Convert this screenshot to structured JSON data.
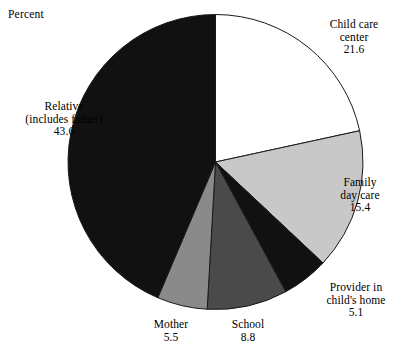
{
  "chart_data": {
    "type": "pie",
    "title": "",
    "subtitle": "",
    "xlabel": "",
    "ylabel": "Percent",
    "unit_note": "Percent",
    "legend_position": "none",
    "grid": false,
    "start_angle_deg": 0,
    "direction": "clockwise",
    "categories": [
      "Child care center",
      "Family day care",
      "Provider in child's home",
      "School",
      "Mother",
      "Relative (includes father)"
    ],
    "values": [
      21.6,
      15.4,
      5.1,
      8.8,
      5.5,
      43.6
    ],
    "total": 100.0,
    "colors": [
      "#ffffff",
      "#c8c8c8",
      "#111111",
      "#4a4a4a",
      "#8a8a8a",
      "#111111"
    ],
    "stroke": "#1a1a1a"
  },
  "labels": [
    {
      "name": "child-care-center",
      "lines": [
        "Child care",
        "center"
      ],
      "value": "21.6",
      "color": "#ffffff"
    },
    {
      "name": "family-day-care",
      "lines": [
        "Family",
        "day care"
      ],
      "value": "15.4",
      "color": "#c8c8c8"
    },
    {
      "name": "provider-in-childs-home",
      "lines": [
        "Provider in",
        "child's home"
      ],
      "value": "5.1",
      "color": "#111111"
    },
    {
      "name": "school",
      "lines": [
        "School"
      ],
      "value": "8.8",
      "color": "#4a4a4a"
    },
    {
      "name": "mother",
      "lines": [
        "Mother"
      ],
      "value": "5.5",
      "color": "#8a8a8a"
    },
    {
      "name": "relative-includes-father",
      "lines": [
        "Relative",
        "(includes father)"
      ],
      "value": "43.6",
      "color": "#111111"
    }
  ],
  "axis_note": "Percent"
}
